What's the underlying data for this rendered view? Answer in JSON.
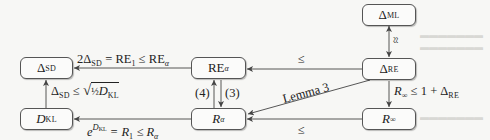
{
  "nodes": {
    "delta_ml": {
      "symbol": "Δ",
      "sub": "ML"
    },
    "delta_re": {
      "symbol": "Δ",
      "sub": "RE"
    },
    "delta_sd": {
      "symbol": "Δ",
      "sub": "SD"
    },
    "re_alpha": {
      "symbol": "RE",
      "sub": "α"
    },
    "d_kl": {
      "symbol": "D",
      "sub": "KL"
    },
    "r_alpha": {
      "symbol": "R",
      "sub": "α"
    },
    "r_inf": {
      "symbol": "R",
      "sub": "∞"
    }
  },
  "edges": {
    "re_alpha_to_delta_sd": {
      "part1": "2Δ",
      "part1_sub": "SD",
      "part2": " = RE",
      "part2_sub": "1",
      "part3": " ≤ RE",
      "part3_sub": "α"
    },
    "delta_re_to_re_alpha": {
      "label": "≤"
    },
    "delta_ml_delta_re": {
      "label": "≈"
    },
    "delta_re_to_r_inf": {
      "part1": "R",
      "part1_sub": "∞",
      "part2": " ≤ 1 + Δ",
      "part2_sub": "RE"
    },
    "delta_re_to_r_alpha": {
      "label": "Lemma 3"
    },
    "r_alpha_to_re_alpha": {
      "label": "(4)"
    },
    "re_alpha_to_r_alpha": {
      "label": "(3)"
    },
    "d_kl_to_delta_sd": {
      "part1": "Δ",
      "part1_sub": "SD",
      "part2": " ≤ ",
      "root_frac": "½",
      "root_sym": "D",
      "root_sub": "KL"
    },
    "r_alpha_to_d_kl": {
      "base": "e",
      "exp": "D",
      "exp_sub": "KL",
      "part2": " = R",
      "part2_sub": "1",
      "part3": " ≤ R",
      "part3_sub": "α"
    },
    "r_inf_to_r_alpha": {
      "label": "≤"
    }
  },
  "colors": {
    "background": "#f7f7f5",
    "node_border": "#555555",
    "edge": "#444444",
    "text": "#222222"
  }
}
